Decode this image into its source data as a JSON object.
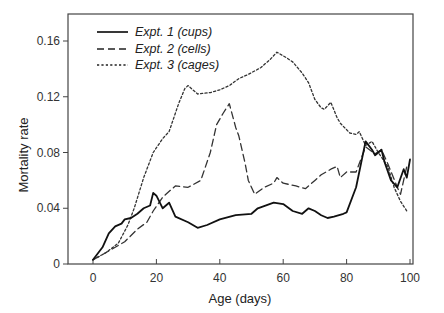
{
  "chart_data": {
    "type": "line",
    "title": "",
    "xlabel": "Age (days)",
    "ylabel": "Mortality rate",
    "xlim": [
      -8,
      101
    ],
    "ylim": [
      0,
      0.178
    ],
    "xticks": [
      0,
      20,
      40,
      60,
      80,
      100
    ],
    "xtick_labels": [
      "0",
      "20",
      "40",
      "60",
      "80",
      "100"
    ],
    "yticks": [
      0,
      0.04,
      0.08,
      0.12,
      0.16
    ],
    "ytick_labels": [
      "0",
      "0.04",
      "0.08",
      "0.12",
      "0.16"
    ],
    "grid": false,
    "legend_position": "upper left",
    "series": [
      {
        "name": "Expt. 1 (cups)",
        "style": "solid",
        "color": "#111111",
        "x": [
          0,
          3,
          5,
          7,
          9,
          10,
          12,
          14,
          16,
          18,
          19,
          20,
          22,
          24,
          26,
          30,
          33,
          36,
          40,
          45,
          50,
          52,
          57,
          60,
          63,
          66,
          68,
          70,
          72,
          74,
          76,
          79,
          80,
          83,
          86,
          88,
          89,
          91,
          92,
          94,
          96,
          98,
          99,
          100
        ],
        "y": [
          0.003,
          0.012,
          0.022,
          0.027,
          0.029,
          0.032,
          0.033,
          0.036,
          0.04,
          0.042,
          0.051,
          0.049,
          0.04,
          0.044,
          0.034,
          0.03,
          0.026,
          0.028,
          0.032,
          0.035,
          0.036,
          0.04,
          0.044,
          0.043,
          0.038,
          0.036,
          0.04,
          0.038,
          0.035,
          0.033,
          0.034,
          0.036,
          0.037,
          0.055,
          0.088,
          0.082,
          0.078,
          0.082,
          0.073,
          0.06,
          0.055,
          0.068,
          0.062,
          0.075
        ]
      },
      {
        "name": "Expt. 2 (cells)",
        "style": "dashed",
        "color": "#333333",
        "x": [
          0,
          4,
          7,
          10,
          14,
          17,
          19,
          22,
          26,
          30,
          34,
          37,
          39,
          41,
          43,
          45,
          46,
          48,
          49,
          51,
          54,
          57,
          58,
          60,
          64,
          67,
          70,
          72,
          75,
          77,
          78,
          80,
          83,
          86,
          89,
          91,
          93,
          96,
          97,
          99
        ],
        "y": [
          0.003,
          0.008,
          0.012,
          0.016,
          0.025,
          0.03,
          0.038,
          0.048,
          0.056,
          0.055,
          0.06,
          0.08,
          0.1,
          0.108,
          0.115,
          0.098,
          0.092,
          0.072,
          0.06,
          0.05,
          0.055,
          0.058,
          0.062,
          0.058,
          0.056,
          0.054,
          0.06,
          0.064,
          0.068,
          0.07,
          0.062,
          0.066,
          0.066,
          0.084,
          0.079,
          0.082,
          0.072,
          0.055,
          0.05,
          0.07
        ]
      },
      {
        "name": "Expt. 3 (cages)",
        "style": "dotted",
        "color": "#333333",
        "x": [
          0,
          4,
          8,
          11,
          13,
          16,
          19,
          22,
          24,
          27,
          29,
          30,
          33,
          37,
          40,
          43,
          46,
          49,
          53,
          56,
          58,
          61,
          63,
          66,
          68,
          70,
          72,
          73,
          75,
          77,
          78,
          81,
          83,
          84,
          86,
          88,
          90,
          93,
          95,
          97,
          99
        ],
        "y": [
          0.003,
          0.008,
          0.015,
          0.028,
          0.04,
          0.062,
          0.08,
          0.09,
          0.095,
          0.115,
          0.126,
          0.128,
          0.122,
          0.123,
          0.125,
          0.128,
          0.133,
          0.136,
          0.141,
          0.147,
          0.152,
          0.148,
          0.145,
          0.137,
          0.13,
          0.118,
          0.112,
          0.111,
          0.116,
          0.105,
          0.101,
          0.094,
          0.093,
          0.095,
          0.085,
          0.088,
          0.08,
          0.07,
          0.055,
          0.045,
          0.038
        ]
      }
    ]
  },
  "legend": {
    "items": [
      {
        "label": "Expt. 1 (cups)",
        "style": "solid"
      },
      {
        "label": "Expt. 2 (cells)",
        "style": "dashed"
      },
      {
        "label": "Expt. 3 (cages)",
        "style": "dotted"
      }
    ]
  },
  "axes": {
    "xlabel": "Age (days)",
    "ylabel": "Mortality rate"
  }
}
